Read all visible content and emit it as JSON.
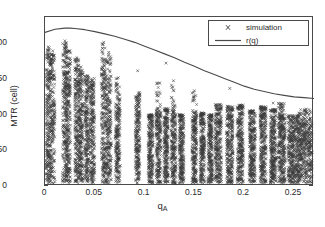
{
  "chart_data": {
    "type": "scatter",
    "title": "",
    "xlabel": "q_A",
    "xlabel_base": "q",
    "xlabel_sub": "A",
    "ylabel": "MTR (cell)",
    "xlim": [
      0,
      0.27
    ],
    "ylim": [
      0,
      220
    ],
    "xticks": [
      0,
      0.05,
      0.1,
      0.15,
      0.2,
      0.25
    ],
    "xticklabels": [
      "0",
      "0.05",
      "0.1",
      "0.15",
      "0.2",
      "0.25"
    ],
    "yticks": [
      0,
      50,
      100,
      150,
      200
    ],
    "yticklabels": [
      "0",
      "50",
      "100",
      "150",
      "200"
    ],
    "grid": false,
    "legend_position": "upper right",
    "colors": {
      "marker": "#3a3a3a",
      "curve": "#4a4a4a",
      "axis": "#4a4a4a",
      "text": "#2b2b2b",
      "background": "#ffffff"
    },
    "series": [
      {
        "name": "simulation",
        "type": "scatter",
        "marker": "x",
        "description": "Dense vertical bands of simulation outcomes at discrete q_A values; each band spans MTR from ~5 up to a band-specific maximum, with sparse isolated outliers above.",
        "bands": [
          {
            "q": 0.003,
            "width": 0.0022,
            "top": 181,
            "dense_top": 166,
            "n": 150
          },
          {
            "q": 0.0075,
            "width": 0.0024,
            "top": 172,
            "dense_top": 160,
            "n": 150
          },
          {
            "q": 0.02,
            "width": 0.0024,
            "top": 188,
            "dense_top": 168,
            "n": 150
          },
          {
            "q": 0.0235,
            "width": 0.0022,
            "top": 176,
            "dense_top": 158,
            "n": 150
          },
          {
            "q": 0.032,
            "width": 0.0022,
            "top": 166,
            "dense_top": 150,
            "n": 150
          },
          {
            "q": 0.036,
            "width": 0.0022,
            "top": 152,
            "dense_top": 140,
            "n": 150
          },
          {
            "q": 0.042,
            "width": 0.0022,
            "top": 145,
            "dense_top": 133,
            "n": 150
          },
          {
            "q": 0.0475,
            "width": 0.0022,
            "top": 140,
            "dense_top": 128,
            "n": 150
          },
          {
            "q": 0.059,
            "width": 0.0024,
            "top": 186,
            "dense_top": 160,
            "n": 150
          },
          {
            "q": 0.064,
            "width": 0.0024,
            "top": 172,
            "dense_top": 150,
            "n": 150
          },
          {
            "q": 0.073,
            "width": 0.0024,
            "top": 140,
            "dense_top": 118,
            "n": 150
          },
          {
            "q": 0.093,
            "width": 0.0022,
            "top": 122,
            "dense_top": 108,
            "n": 150
          },
          {
            "q": 0.106,
            "width": 0.0024,
            "top": 93,
            "dense_top": 90,
            "n": 150
          },
          {
            "q": 0.114,
            "width": 0.0024,
            "top": 135,
            "dense_top": 100,
            "n": 150
          },
          {
            "q": 0.1215,
            "width": 0.0022,
            "top": 101,
            "dense_top": 96,
            "n": 150
          },
          {
            "q": 0.129,
            "width": 0.0024,
            "top": 138,
            "dense_top": 100,
            "n": 150
          },
          {
            "q": 0.137,
            "width": 0.0024,
            "top": 93,
            "dense_top": 90,
            "n": 150
          },
          {
            "q": 0.15,
            "width": 0.0024,
            "top": 124,
            "dense_top": 100,
            "n": 150
          },
          {
            "q": 0.158,
            "width": 0.0022,
            "top": 95,
            "dense_top": 92,
            "n": 150
          },
          {
            "q": 0.166,
            "width": 0.0022,
            "top": 93,
            "dense_top": 90,
            "n": 150
          },
          {
            "q": 0.174,
            "width": 0.0032,
            "top": 106,
            "dense_top": 100,
            "n": 180
          },
          {
            "q": 0.1855,
            "width": 0.0032,
            "top": 104,
            "dense_top": 99,
            "n": 180
          },
          {
            "q": 0.196,
            "width": 0.0032,
            "top": 106,
            "dense_top": 100,
            "n": 180
          },
          {
            "q": 0.208,
            "width": 0.003,
            "top": 98,
            "dense_top": 94,
            "n": 180
          },
          {
            "q": 0.219,
            "width": 0.003,
            "top": 104,
            "dense_top": 99,
            "n": 180
          },
          {
            "q": 0.229,
            "width": 0.0028,
            "top": 100,
            "dense_top": 96,
            "n": 180
          },
          {
            "q": 0.2375,
            "width": 0.0036,
            "top": 108,
            "dense_top": 96,
            "n": 200
          },
          {
            "q": 0.249,
            "width": 0.005,
            "top": 92,
            "dense_top": 84,
            "n": 240
          },
          {
            "q": 0.261,
            "width": 0.007,
            "top": 100,
            "dense_top": 86,
            "n": 300
          }
        ],
        "outliers": [
          {
            "q": 0.0032,
            "y": 181
          },
          {
            "q": 0.0078,
            "y": 176
          },
          {
            "q": 0.02,
            "y": 189
          },
          {
            "q": 0.0238,
            "y": 176
          },
          {
            "q": 0.032,
            "y": 167
          },
          {
            "q": 0.0362,
            "y": 155
          },
          {
            "q": 0.059,
            "y": 187
          },
          {
            "q": 0.064,
            "y": 174
          },
          {
            "q": 0.0735,
            "y": 141
          },
          {
            "q": 0.093,
            "y": 150
          },
          {
            "q": 0.114,
            "y": 134
          },
          {
            "q": 0.1215,
            "y": 160
          },
          {
            "q": 0.129,
            "y": 137
          },
          {
            "q": 0.15,
            "y": 124
          },
          {
            "q": 0.1855,
            "y": 127
          },
          {
            "q": 0.229,
            "y": 108
          },
          {
            "q": 0.2375,
            "y": 107
          },
          {
            "q": 0.262,
            "y": 100
          }
        ]
      },
      {
        "name": "r(q)",
        "type": "line",
        "description": "Smooth theoretical curve, rising slightly to a maximum near q_A = 0.025 then decreasing monotonically.",
        "x": [
          0.0,
          0.01,
          0.02,
          0.025,
          0.03,
          0.04,
          0.05,
          0.06,
          0.07,
          0.08,
          0.09,
          0.1,
          0.11,
          0.12,
          0.13,
          0.14,
          0.15,
          0.16,
          0.17,
          0.18,
          0.19,
          0.2,
          0.21,
          0.22,
          0.23,
          0.24,
          0.25,
          0.26,
          0.27
        ],
        "y": [
          200,
          204,
          205.5,
          205.5,
          205,
          203.5,
          201,
          198,
          195,
          191,
          187,
          182,
          177,
          172,
          167,
          161,
          156,
          150,
          145,
          140,
          135,
          130,
          126,
          123,
          120,
          118,
          116,
          115,
          114
        ]
      }
    ]
  },
  "legend": {
    "items": [
      {
        "label": "simulation",
        "marker": "x"
      },
      {
        "label": "r(q)",
        "marker": "line"
      }
    ]
  }
}
